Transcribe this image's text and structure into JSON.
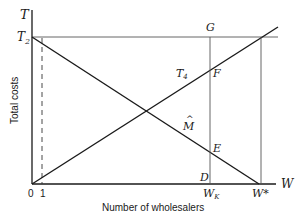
{
  "diagram": {
    "type": "economics-cost-diagram",
    "axes": {
      "y_axis_symbol": "T",
      "x_axis_symbol": "W",
      "y_label": "Total costs",
      "x_label": "Number of wholesalers",
      "origin_label": "0",
      "tick_one_label": "1"
    },
    "points": {
      "T2": "T",
      "T2_sub": "2",
      "T4": "T",
      "T4_sub": "4",
      "G": "G",
      "F": "F",
      "E": "E",
      "D": "D",
      "M_hat": "M",
      "M_hat_accent": "^",
      "WK": "W",
      "WK_sub": "K",
      "Wstar": "W*"
    },
    "lines": [
      {
        "name": "rising-cost-line",
        "from": "origin",
        "to": "upper-right",
        "label": "T4"
      },
      {
        "name": "falling-cost-line",
        "from": "T2",
        "to": "W*",
        "label": "M-hat"
      },
      {
        "name": "T2-horizontal",
        "from": "T2",
        "to": "right"
      },
      {
        "name": "WK-vertical",
        "through": [
          "G",
          "F",
          "E",
          "D"
        ]
      },
      {
        "name": "Wstar-vertical",
        "from": "W*",
        "to": "T2-level"
      },
      {
        "name": "dashed-at-1",
        "style": "dashed"
      }
    ],
    "colors": {
      "ink": "#1a1a1a",
      "thin": "#555555",
      "background": "#ffffff"
    }
  }
}
